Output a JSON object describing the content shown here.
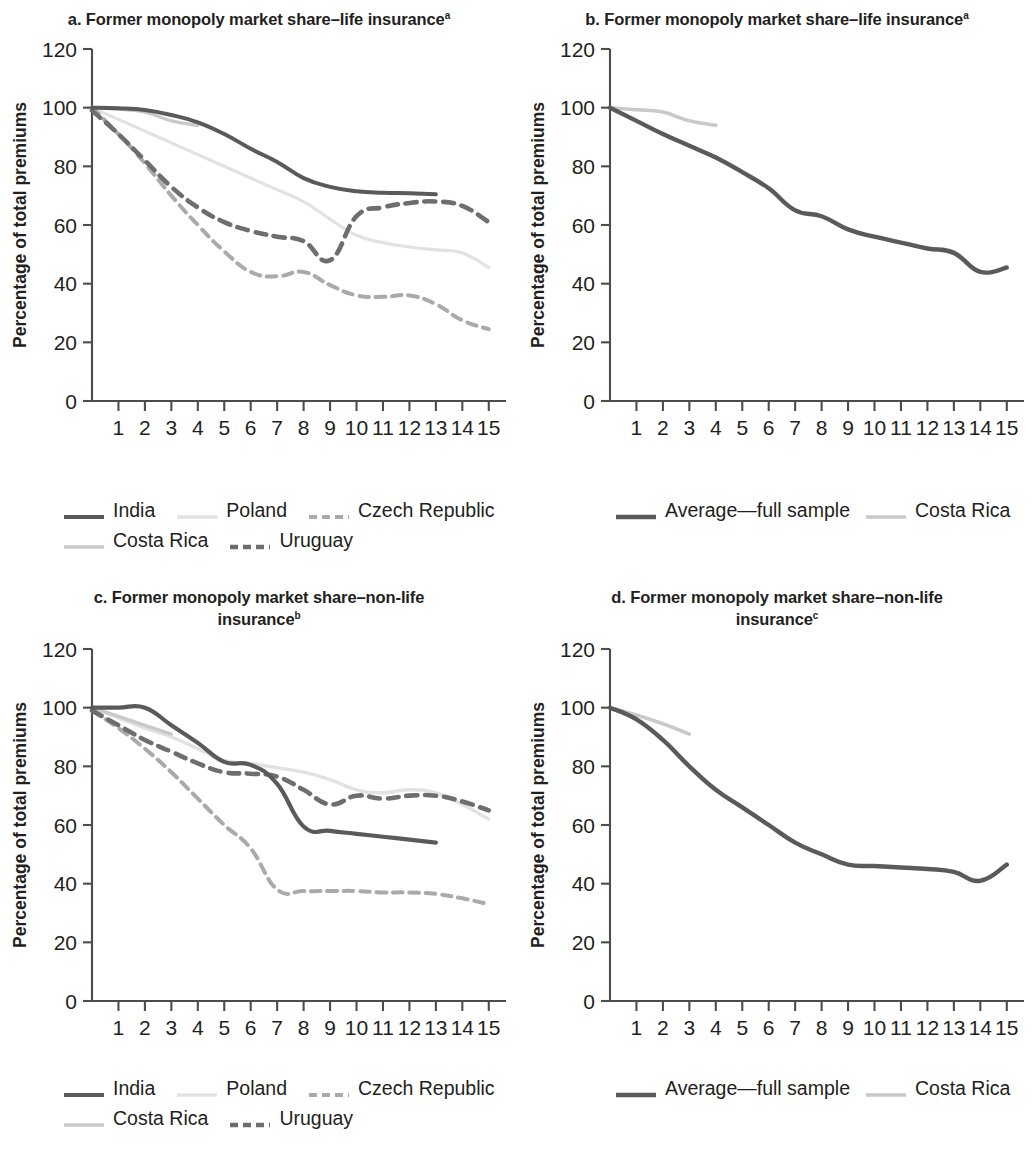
{
  "figure": {
    "background": "#ffffff",
    "axis_color": "#4c4c4c",
    "text_color": "#231f20"
  },
  "colors": {
    "india": "#5a5a5a",
    "poland": "#e2e2e2",
    "czech_republic": "#aaaaaa",
    "costa_rica": "#c9c9c9",
    "uruguay": "#6e6e6e",
    "average_full_sample": "#5a5a5a"
  },
  "panels": [
    {
      "id": "panel-a",
      "title": "a. Former monopoly market share–life",
      "title_line2": "insurance",
      "title_sup": "a",
      "xlabel": "Years postliberalization",
      "ylabel": "Percentage of total premiums",
      "legend": [
        [
          {
            "label": "India",
            "key": "india"
          },
          {
            "label": "Poland",
            "key": "poland"
          },
          {
            "label": "Czech Republic",
            "key": "czech_republic"
          }
        ],
        [
          {
            "label": "Costa Rica",
            "key": "costa_rica"
          },
          {
            "label": "Uruguay",
            "key": "uruguay"
          }
        ]
      ]
    },
    {
      "id": "panel-b",
      "title": "b. Former monopoly market share–life",
      "title_line2": "insurance",
      "title_sup": "a",
      "xlabel": "Years postliberalization",
      "ylabel": "Percentage of total premiums",
      "legend": [
        [
          {
            "label": "Average—full sample",
            "key": "average_full_sample"
          },
          {
            "label": "Costa Rica",
            "key": "costa_rica"
          }
        ]
      ]
    },
    {
      "id": "panel-c",
      "title": "c. Former monopoly market share–non-life",
      "title_line2": "insurance",
      "title_sup": "b",
      "xlabel": "Years postliberalization",
      "ylabel": "Percentage of total premiums",
      "legend": [
        [
          {
            "label": "India",
            "key": "india"
          },
          {
            "label": "Poland",
            "key": "poland"
          },
          {
            "label": "Czech Republic",
            "key": "czech_republic"
          }
        ],
        [
          {
            "label": "Costa Rica",
            "key": "costa_rica"
          },
          {
            "label": "Uruguay",
            "key": "uruguay"
          }
        ]
      ]
    },
    {
      "id": "panel-d",
      "title": "d. Former monopoly market share–non-life",
      "title_line2": "insurance",
      "title_sup": "c",
      "xlabel": "Years postliberalization",
      "ylabel": "Percentage of total premiums",
      "legend": [
        [
          {
            "label": "Average—full sample",
            "key": "average_full_sample"
          },
          {
            "label": "Costa Rica",
            "key": "costa_rica"
          }
        ]
      ]
    }
  ],
  "chart_data": [
    {
      "type": "line",
      "panel": "a",
      "title": "a. Former monopoly market share–life insurance",
      "xlabel": "Years postliberalization",
      "ylabel": "Percentage of total premiums",
      "xlim": [
        0,
        15.5
      ],
      "ylim": [
        0,
        120
      ],
      "yticks": [
        0,
        20,
        40,
        60,
        80,
        100,
        120
      ],
      "xticks": [
        1,
        2,
        3,
        4,
        5,
        6,
        7,
        8,
        9,
        10,
        11,
        12,
        13,
        14,
        15
      ],
      "grid": false,
      "legend_position": "below",
      "series": [
        {
          "name": "India",
          "color": "#5a5a5a",
          "style": "solid",
          "width": 4.0,
          "x": [
            0,
            1,
            2,
            3,
            4,
            5,
            6,
            7,
            8,
            9,
            10,
            11,
            12,
            13
          ],
          "values": [
            100,
            99.8,
            99.2,
            97.5,
            95,
            91,
            86,
            81.5,
            76,
            73,
            71.5,
            71,
            70.8,
            70.5
          ]
        },
        {
          "name": "Poland",
          "color": "#e2e2e2",
          "style": "solid",
          "width": 3.2,
          "x": [
            0,
            1,
            2,
            3,
            4,
            5,
            6,
            7,
            8,
            9,
            10,
            11,
            12,
            13,
            14,
            15
          ],
          "values": [
            100,
            96,
            92,
            88,
            84,
            80,
            76,
            72,
            68,
            62,
            56.5,
            54,
            52.5,
            51.5,
            50.5,
            45.5
          ]
        },
        {
          "name": "Czech Republic",
          "color": "#aaaaaa",
          "style": "dashed",
          "width": 4.0,
          "x": [
            0,
            1,
            2,
            3,
            4,
            5,
            6,
            7,
            8,
            9,
            10,
            11,
            12,
            13,
            14,
            15
          ],
          "values": [
            100,
            91,
            81,
            70,
            60,
            51,
            44,
            42.5,
            44,
            39.5,
            36,
            35.5,
            36,
            33,
            27.5,
            24.5
          ]
        },
        {
          "name": "Costa Rica",
          "color": "#c9c9c9",
          "style": "solid",
          "width": 3.4,
          "x": [
            0,
            1,
            2,
            3,
            4
          ],
          "values": [
            100,
            99.5,
            98.5,
            95.5,
            94
          ]
        },
        {
          "name": "Uruguay",
          "color": "#6e6e6e",
          "style": "dashed",
          "width": 4.6,
          "x": [
            0,
            1,
            2,
            3,
            4,
            5,
            6,
            7,
            8,
            9,
            10,
            11,
            12,
            13,
            14,
            15
          ],
          "values": [
            99,
            91,
            82,
            73,
            66,
            61,
            58,
            56,
            54.5,
            48,
            63,
            66,
            67.5,
            68,
            66.5,
            61
          ]
        }
      ]
    },
    {
      "type": "line",
      "panel": "b",
      "title": "b. Former monopoly market share–life insurance",
      "xlabel": "Years postliberalization",
      "ylabel": "Percentage of total premiums",
      "xlim": [
        0,
        15.5
      ],
      "ylim": [
        0,
        120
      ],
      "yticks": [
        0,
        20,
        40,
        60,
        80,
        100,
        120
      ],
      "xticks": [
        1,
        2,
        3,
        4,
        5,
        6,
        7,
        8,
        9,
        10,
        11,
        12,
        13,
        14,
        15
      ],
      "grid": false,
      "legend_position": "below",
      "series": [
        {
          "name": "Average—full sample",
          "color": "#5a5a5a",
          "style": "solid",
          "width": 4.4,
          "x": [
            0,
            1,
            2,
            3,
            4,
            5,
            6,
            7,
            8,
            9,
            10,
            11,
            12,
            13,
            14,
            15
          ],
          "values": [
            100,
            95.5,
            91,
            87,
            83,
            78,
            72.5,
            65,
            63,
            58.5,
            56,
            54,
            52,
            50.5,
            44,
            45.5
          ]
        },
        {
          "name": "Costa Rica",
          "color": "#c9c9c9",
          "style": "solid",
          "width": 3.6,
          "x": [
            0,
            1,
            2,
            3,
            4
          ],
          "values": [
            100,
            99.3,
            98.5,
            95.5,
            94
          ]
        }
      ]
    },
    {
      "type": "line",
      "panel": "c",
      "title": "c. Former monopoly market share–non-life insurance",
      "xlabel": "Years postliberalization",
      "ylabel": "Percentage of total premiums",
      "xlim": [
        0,
        15.5
      ],
      "ylim": [
        0,
        120
      ],
      "yticks": [
        0,
        20,
        40,
        60,
        80,
        100,
        120
      ],
      "xticks": [
        1,
        2,
        3,
        4,
        5,
        6,
        7,
        8,
        9,
        10,
        11,
        12,
        13,
        14,
        15
      ],
      "grid": false,
      "legend_position": "below",
      "series": [
        {
          "name": "India",
          "color": "#5a5a5a",
          "style": "solid",
          "width": 4.2,
          "x": [
            0,
            1,
            2,
            3,
            4,
            5,
            6,
            7,
            8,
            9,
            10,
            11,
            12,
            13
          ],
          "values": [
            100,
            100,
            100,
            94,
            88,
            81.5,
            80.5,
            74,
            59.5,
            58,
            57,
            56,
            55,
            54
          ]
        },
        {
          "name": "Poland",
          "color": "#e2e2e2",
          "style": "solid",
          "width": 3.4,
          "x": [
            0,
            1,
            2,
            3,
            4,
            5,
            6,
            7,
            8,
            9,
            10,
            11,
            12,
            13,
            14,
            15
          ],
          "values": [
            100,
            96.5,
            93,
            90,
            86,
            82,
            81,
            79.5,
            78,
            75.5,
            72,
            71,
            72,
            71,
            67,
            62
          ]
        },
        {
          "name": "Czech Republic",
          "color": "#aaaaaa",
          "style": "dashed",
          "width": 4.0,
          "x": [
            0,
            1,
            2,
            3,
            4,
            5,
            6,
            7,
            8,
            9,
            10,
            11,
            12,
            13,
            14,
            15
          ],
          "values": [
            99,
            93,
            86,
            78,
            69,
            60,
            52,
            38,
            37.5,
            37.5,
            37.5,
            37,
            37,
            36.5,
            35,
            33
          ]
        },
        {
          "name": "Costa Rica",
          "color": "#c9c9c9",
          "style": "solid",
          "width": 3.4,
          "x": [
            0,
            1,
            2,
            3
          ],
          "values": [
            100,
            97,
            94,
            91
          ]
        },
        {
          "name": "Uruguay",
          "color": "#6e6e6e",
          "style": "dashed",
          "width": 4.6,
          "x": [
            0,
            1,
            2,
            3,
            4,
            5,
            6,
            7,
            8,
            9,
            10,
            11,
            12,
            13,
            14,
            15
          ],
          "values": [
            99,
            94,
            89,
            85,
            81,
            78,
            77.5,
            76.5,
            72,
            67,
            70,
            69,
            70,
            70,
            68,
            65
          ]
        }
      ]
    },
    {
      "type": "line",
      "panel": "d",
      "title": "d. Former monopoly market share–non-life insurance",
      "xlabel": "Years postliberalization",
      "ylabel": "Percentage of total premiums",
      "xlim": [
        0,
        15.5
      ],
      "ylim": [
        0,
        120
      ],
      "yticks": [
        0,
        20,
        40,
        60,
        80,
        100,
        120
      ],
      "xticks": [
        1,
        2,
        3,
        4,
        5,
        6,
        7,
        8,
        9,
        10,
        11,
        12,
        13,
        14,
        15
      ],
      "grid": false,
      "legend_position": "below",
      "series": [
        {
          "name": "Average—full sample",
          "color": "#5a5a5a",
          "style": "solid",
          "width": 4.4,
          "x": [
            0,
            1,
            2,
            3,
            4,
            5,
            6,
            7,
            8,
            9,
            10,
            11,
            12,
            13,
            14,
            15
          ],
          "values": [
            100,
            96,
            89,
            80,
            72,
            66,
            60,
            54,
            50,
            46.5,
            46,
            45.5,
            45,
            44,
            41,
            46.5
          ]
        },
        {
          "name": "Costa Rica",
          "color": "#c9c9c9",
          "style": "solid",
          "width": 3.6,
          "x": [
            0,
            1,
            2,
            3
          ],
          "values": [
            100,
            97.5,
            94.5,
            91
          ]
        }
      ]
    }
  ]
}
